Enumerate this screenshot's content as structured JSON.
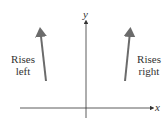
{
  "diagram": {
    "axes": {
      "x_label": "x",
      "y_label": "y"
    },
    "annotations": [
      {
        "id": "left",
        "line1": "Rises",
        "line2": "left",
        "arrow_direction": "up"
      },
      {
        "id": "right",
        "line1": "Rises",
        "line2": "right",
        "arrow_direction": "up"
      }
    ],
    "colors": {
      "axis": "#333333",
      "arrow": "#6b6b6b",
      "text": "#333333"
    }
  }
}
